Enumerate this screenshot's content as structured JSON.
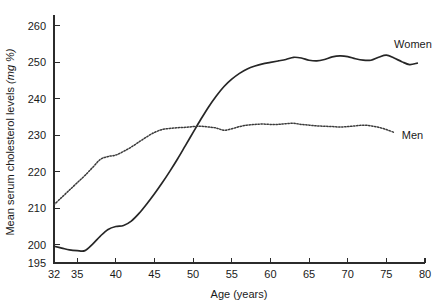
{
  "chart_data": {
    "type": "line",
    "title": "",
    "xlabel": "Age (years)",
    "ylabel": "Mean serum cholesterol levels (mg %)",
    "ylabel_plain": "Mean serum cholesterol levels",
    "ylabel_italic": "(mg %)",
    "xlim": [
      32,
      80
    ],
    "ylim": [
      195,
      263
    ],
    "grid": false,
    "legend_position": "inline-right",
    "xticks": [
      32,
      35,
      40,
      45,
      50,
      55,
      60,
      65,
      70,
      75,
      80
    ],
    "xtick_labels": [
      "32",
      "35",
      "40",
      "45",
      "50",
      "55",
      "60",
      "65",
      "70",
      "75",
      "80"
    ],
    "yticks": [
      195,
      200,
      210,
      220,
      230,
      240,
      250,
      260
    ],
    "ytick_labels": [
      "195",
      "200",
      "210",
      "220",
      "230",
      "240",
      "250",
      "260"
    ],
    "series": [
      {
        "name": "Women",
        "style": "solid",
        "color": "#262626",
        "label_x": 76,
        "label_y": 254,
        "x": [
          32,
          33,
          34,
          35,
          36,
          37,
          38,
          39,
          40,
          41,
          42,
          43,
          44,
          45,
          46,
          47,
          48,
          49,
          50,
          51,
          52,
          53,
          54,
          55,
          56,
          57,
          58,
          59,
          60,
          61,
          62,
          63,
          64,
          65,
          66,
          67,
          68,
          69,
          70,
          71,
          72,
          73,
          74,
          75,
          76,
          77,
          78,
          79
        ],
        "y": [
          199.6,
          199.1,
          198.6,
          198.4,
          198.4,
          200.2,
          202.4,
          204.2,
          205.0,
          205.3,
          206.5,
          208.6,
          211.2,
          214.0,
          217.0,
          220.2,
          223.6,
          227.2,
          230.8,
          234.4,
          237.8,
          240.8,
          243.4,
          245.4,
          247.0,
          248.2,
          249.0,
          249.6,
          250.0,
          250.4,
          250.8,
          251.4,
          251.2,
          250.6,
          250.4,
          250.8,
          251.5,
          251.8,
          251.6,
          251.0,
          250.6,
          250.6,
          251.4,
          252.0,
          251.2,
          250.2,
          249.4,
          249.8
        ]
      },
      {
        "name": "Men",
        "style": "dotted",
        "color": "#3a3a3a",
        "label_x": 77,
        "label_y": 229,
        "x": [
          32,
          33,
          34,
          35,
          36,
          37,
          38,
          39,
          40,
          41,
          42,
          43,
          44,
          45,
          46,
          47,
          48,
          49,
          50,
          51,
          52,
          53,
          54,
          55,
          56,
          57,
          58,
          59,
          60,
          61,
          62,
          63,
          64,
          65,
          66,
          67,
          68,
          69,
          70,
          71,
          72,
          73,
          74,
          75,
          76
        ],
        "y": [
          211.0,
          213.0,
          215.0,
          217.0,
          219.0,
          221.2,
          223.4,
          224.2,
          224.6,
          225.6,
          226.8,
          228.2,
          229.6,
          230.8,
          231.6,
          231.9,
          232.1,
          232.2,
          232.4,
          232.5,
          232.3,
          232.0,
          231.4,
          231.8,
          232.4,
          232.8,
          233.0,
          233.1,
          233.0,
          233.0,
          233.2,
          233.3,
          233.0,
          232.8,
          232.6,
          232.5,
          232.4,
          232.3,
          232.4,
          232.6,
          232.8,
          232.6,
          232.2,
          231.6,
          230.8
        ]
      }
    ]
  }
}
